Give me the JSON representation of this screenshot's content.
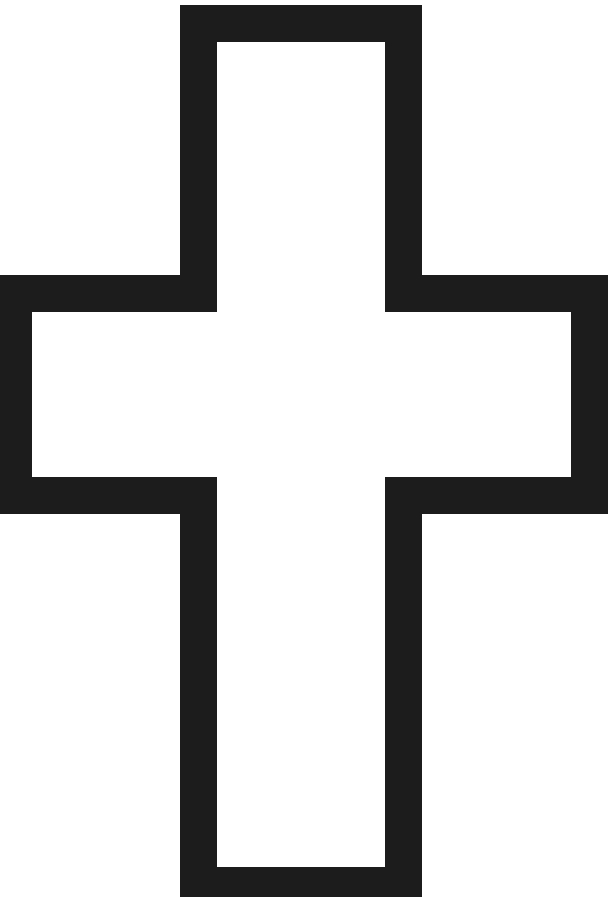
{
  "canvas": {
    "width": 612,
    "height": 897,
    "background_color": "#ffffff",
    "title": "Cross Outline Figure"
  },
  "figure": {
    "name": "greek-cross-outline",
    "stroke_color": "#1c1c1c",
    "fill_color": "#ffffff",
    "stroke_width": 37,
    "vertical_bar": {
      "left": 198,
      "right": 403,
      "top": 23,
      "bottom": 885,
      "width": 205,
      "height": 862
    },
    "horizontal_bar": {
      "left": 13,
      "right": 589,
      "top": 293,
      "bottom": 495,
      "width": 576,
      "height": 202
    },
    "outline_points": "198,23 403,23 403,293 589,293 589,495 403,495 403,885 198,885 198,495 13,495 13,293 198,293",
    "inner_cells": [
      {
        "name": "top-arm-cell",
        "x": 235,
        "y": 60,
        "width": 131,
        "height": 272
      },
      {
        "name": "left-arm-cell",
        "x": 50,
        "y": 330,
        "width": 148,
        "height": 128
      },
      {
        "name": "center-cell",
        "x": 235,
        "y": 330,
        "width": 131,
        "height": 128
      },
      {
        "name": "right-arm-cell",
        "x": 403,
        "y": 330,
        "width": 149,
        "height": 128
      },
      {
        "name": "bottom-arm-cell",
        "x": 235,
        "y": 458,
        "width": 131,
        "height": 390
      }
    ]
  }
}
